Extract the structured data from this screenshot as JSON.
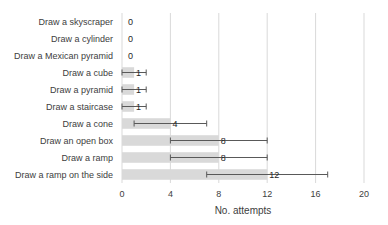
{
  "chart_data": {
    "type": "bar",
    "orientation": "horizontal",
    "title": "",
    "xlabel": "No. attempts",
    "ylabel": "",
    "xlim": [
      0,
      20
    ],
    "x_ticks": [
      0,
      4,
      8,
      12,
      16,
      20
    ],
    "grid": {
      "vertical": true,
      "horizontal": false
    },
    "legend": null,
    "bar_color": "#d9d9d9",
    "categories": [
      "Draw a skyscraper",
      "Draw a cylinder",
      "Draw a Mexican pyramid",
      "Draw a cube",
      "Draw a pyramid",
      "Draw a staircase",
      "Draw a cone",
      "Draw an open box",
      "Draw a ramp",
      "Draw a ramp on the side"
    ],
    "values": [
      0,
      0,
      0,
      1,
      1,
      1,
      4,
      8,
      8,
      12
    ],
    "data_labels": [
      "0",
      "0",
      "0",
      "1",
      "1",
      "1",
      "4",
      "8",
      "8",
      "12"
    ],
    "error_bars": [
      null,
      null,
      null,
      {
        "low": 0,
        "high": 2
      },
      {
        "low": 0,
        "high": 2
      },
      {
        "low": 0,
        "high": 2
      },
      {
        "low": 1,
        "high": 7
      },
      {
        "low": 4,
        "high": 12
      },
      {
        "low": 4,
        "high": 12
      },
      {
        "low": 7,
        "high": 17
      }
    ]
  }
}
